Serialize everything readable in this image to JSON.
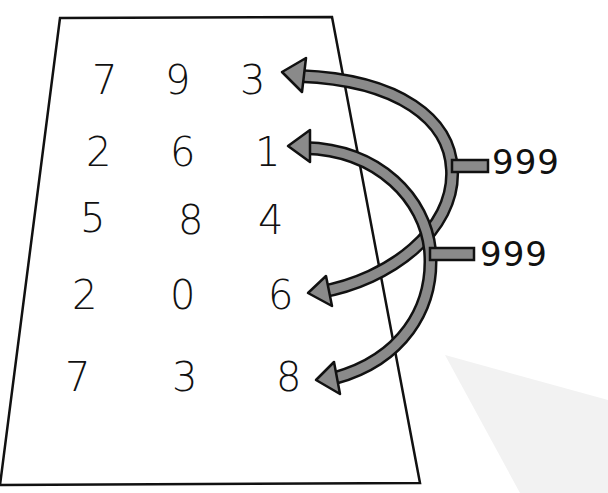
{
  "grid": {
    "rows": [
      [
        "7",
        "9",
        "3"
      ],
      [
        "2",
        "6",
        "1"
      ],
      [
        "5",
        "8",
        "4"
      ],
      [
        "2",
        "0",
        "6"
      ],
      [
        "7",
        "3",
        "8"
      ]
    ]
  },
  "labels": {
    "top": "999",
    "bottom": "999"
  },
  "colors": {
    "arrow_fill": "#8a8a8a",
    "outline": "#111111",
    "paper": "#ffffff",
    "shadow": "#f1f1f1"
  }
}
